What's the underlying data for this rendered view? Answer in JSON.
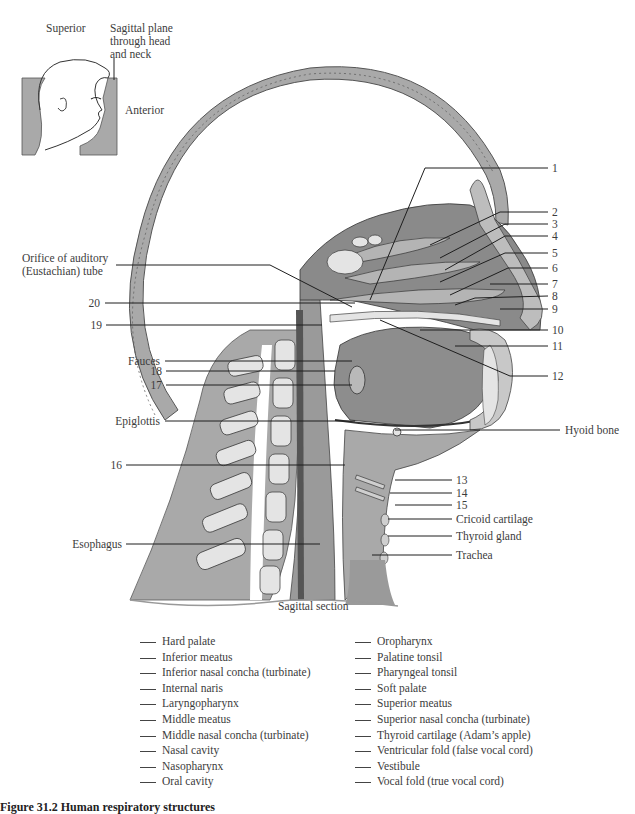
{
  "inset": {
    "superior_label": "Superior",
    "plane_label_lines": [
      "Sagittal plane",
      "through head",
      "and neck"
    ],
    "anterior_label": "Anterior"
  },
  "diagram": {
    "section_label": "Sagittal section",
    "left_labels": [
      {
        "id": "orifice",
        "lines": [
          "Orifice of auditory",
          "(Eustachian) tube"
        ]
      },
      {
        "id": "n20",
        "text": "20"
      },
      {
        "id": "n19",
        "text": "19"
      },
      {
        "id": "fauces",
        "text": "Fauces"
      },
      {
        "id": "n18",
        "text": "18"
      },
      {
        "id": "n17",
        "text": "17"
      },
      {
        "id": "epiglottis",
        "text": "Epiglottis"
      },
      {
        "id": "n16",
        "text": "16"
      },
      {
        "id": "esophagus",
        "text": "Esophagus"
      }
    ],
    "right_labels": [
      {
        "id": "n1",
        "text": "1"
      },
      {
        "id": "n2",
        "text": "2"
      },
      {
        "id": "n3",
        "text": "3"
      },
      {
        "id": "n4",
        "text": "4"
      },
      {
        "id": "n5",
        "text": "5"
      },
      {
        "id": "n6",
        "text": "6"
      },
      {
        "id": "n7",
        "text": "7"
      },
      {
        "id": "n8",
        "text": "8"
      },
      {
        "id": "n9",
        "text": "9"
      },
      {
        "id": "n10",
        "text": "10"
      },
      {
        "id": "n11",
        "text": "11"
      },
      {
        "id": "n12",
        "text": "12"
      },
      {
        "id": "hyoid",
        "text": "Hyoid bone"
      },
      {
        "id": "n13",
        "text": "13"
      },
      {
        "id": "n14",
        "text": "14"
      },
      {
        "id": "n15",
        "text": "15"
      },
      {
        "id": "cricoid",
        "text": "Cricoid cartilage"
      },
      {
        "id": "thyroid_gland",
        "text": "Thyroid gland"
      },
      {
        "id": "trachea",
        "text": "Trachea"
      }
    ]
  },
  "answer_key": {
    "left_column": [
      "Hard palate",
      "Inferior meatus",
      "Inferior nasal concha (turbinate)",
      "Internal naris",
      "Laryngopharynx",
      "Middle meatus",
      "Middle nasal concha (turbinate)",
      "Nasal cavity",
      "Nasopharynx",
      "Oral cavity"
    ],
    "right_column": [
      "Oropharynx",
      "Palatine tonsil",
      "Pharyngeal tonsil",
      "Soft palate",
      "Superior meatus",
      "Superior nasal concha (turbinate)",
      "Thyroid cartilage (Adam’s apple)",
      "Ventricular fold (false vocal cord)",
      "Vestibule",
      "Vocal fold (true vocal cord)"
    ]
  },
  "caption": {
    "text": "Figure 31.2   Human respiratory structures"
  },
  "colors": {
    "tissue_gray": "#a9a9a9",
    "dark_tissue": "#6e6e6e",
    "bone": "#e6e6e6",
    "line": "#1e1e1e"
  }
}
